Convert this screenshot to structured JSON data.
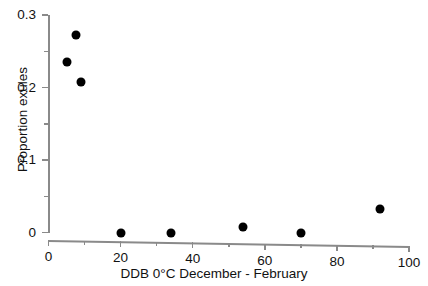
{
  "chart_data": {
    "type": "scatter",
    "title": "",
    "xlabel": "DDB 0°C December - February",
    "ylabel": "Proportion exules",
    "xlim": [
      0,
      100
    ],
    "ylim": [
      0,
      0.3
    ],
    "grid": false,
    "legend": null,
    "marker": {
      "shape": "circle",
      "filled": true,
      "color": "#000000",
      "size_px": 9
    },
    "x": [
      5,
      7.5,
      9,
      20,
      34,
      54,
      70,
      92
    ],
    "y": [
      0.235,
      0.273,
      0.208,
      0.0,
      0.0,
      0.008,
      0.0,
      0.033
    ],
    "points": [
      {
        "x": 5,
        "y": 0.235
      },
      {
        "x": 7.5,
        "y": 0.273
      },
      {
        "x": 9,
        "y": 0.208
      },
      {
        "x": 20,
        "y": 0.0
      },
      {
        "x": 34,
        "y": 0.0
      },
      {
        "x": 54,
        "y": 0.008
      },
      {
        "x": 70,
        "y": 0.0
      },
      {
        "x": 92,
        "y": 0.033
      }
    ],
    "x_ticks": [
      {
        "value": 0,
        "label": "0"
      },
      {
        "value": 20,
        "label": "20"
      },
      {
        "value": 40,
        "label": "40"
      },
      {
        "value": 60,
        "label": "60"
      },
      {
        "value": 80,
        "label": "80"
      },
      {
        "value": 100,
        "label": "100"
      }
    ],
    "x_minor_ticks": [
      10,
      30,
      50,
      70,
      90
    ],
    "y_ticks": [
      {
        "value": 0,
        "label": "0"
      },
      {
        "value": 0.1,
        "label": "0.1"
      },
      {
        "value": 0.2,
        "label": "0.2"
      },
      {
        "value": 0.3,
        "label": "0.3"
      }
    ],
    "y_minor_ticks": [
      0.05,
      0.15,
      0.25
    ],
    "colors": {
      "marker": "#000000",
      "axis": "#8a8a8a",
      "text": "#111111",
      "background": "#ffffff"
    }
  }
}
